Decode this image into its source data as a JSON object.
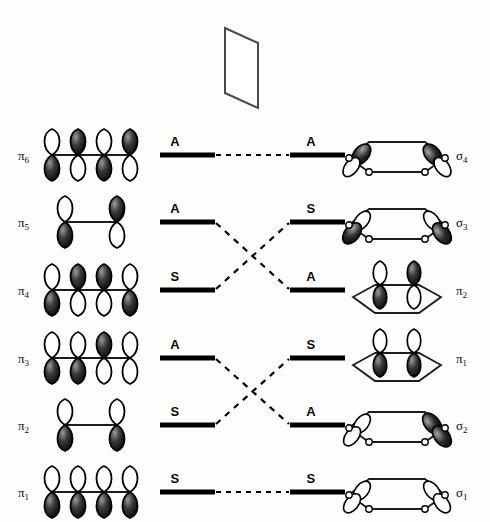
{
  "figure": {
    "type": "orbital-correlation-diagram",
    "title": "",
    "mirror_plane": {
      "name": "mirror-plane-symbol",
      "shape": "parallelogram"
    },
    "columns": {
      "left_label_header": "",
      "right_label_header": ""
    },
    "rows": [
      {
        "index": 0,
        "y": 155,
        "left_term": "π",
        "left_sub": "6",
        "left_symmetry": "A",
        "right_symmetry": "A",
        "right_term": "σ",
        "right_sub": "4",
        "left_structure": "four-p-orbital-chain",
        "right_structure": "hexagon-sigma",
        "correlation": "straight",
        "correlates_to_row": 0
      },
      {
        "index": 1,
        "y": 222,
        "left_term": "π",
        "left_sub": "5",
        "left_symmetry": "A",
        "right_symmetry": "S",
        "right_term": "σ",
        "right_sub": "3",
        "left_structure": "two-p-orbital-pair",
        "right_structure": "hexagon-sigma",
        "correlation": "cross-down",
        "correlates_to_row": 2
      },
      {
        "index": 2,
        "y": 290,
        "left_term": "π",
        "left_sub": "4",
        "left_symmetry": "S",
        "right_symmetry": "A",
        "right_term": "π",
        "right_sub": "2",
        "left_structure": "four-p-orbital-chain",
        "right_structure": "hexagon-pi",
        "correlation": "cross-up",
        "correlates_to_row": 1
      },
      {
        "index": 3,
        "y": 358,
        "left_term": "π",
        "left_sub": "3",
        "left_symmetry": "A",
        "right_symmetry": "S",
        "right_term": "π",
        "right_sub": "1",
        "left_structure": "four-p-orbital-chain",
        "right_structure": "hexagon-pi",
        "correlation": "cross-down",
        "correlates_to_row": 4
      },
      {
        "index": 4,
        "y": 425,
        "left_term": "π",
        "left_sub": "2",
        "left_symmetry": "S",
        "right_symmetry": "A",
        "right_term": "σ",
        "right_sub": "2",
        "left_structure": "two-p-orbital-pair",
        "right_structure": "hexagon-sigma",
        "correlation": "cross-up",
        "correlates_to_row": 3
      },
      {
        "index": 5,
        "y": 492,
        "left_term": "π",
        "left_sub": "1",
        "left_symmetry": "S",
        "right_symmetry": "S",
        "right_term": "σ",
        "right_sub": "1",
        "left_structure": "four-p-orbital-chain",
        "right_structure": "hexagon-sigma",
        "correlation": "straight",
        "correlates_to_row": 5
      }
    ],
    "colors": {
      "ink": "#000000",
      "background": "#fdfdfc",
      "lobe_dark": "#1a1a1a",
      "lobe_light": "#ffffff",
      "line": "#2a2a2a"
    }
  }
}
